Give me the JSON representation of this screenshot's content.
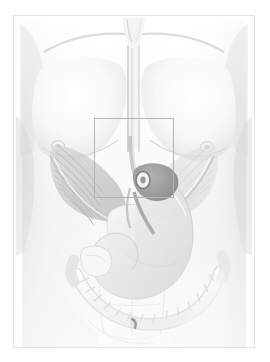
{
  "plate": {
    "title": "Anatomical illustration of male torso",
    "description": "Faded grayscale medical illustration: anterior view of a male thorax and abdomen with superficial musculature, stomach, and colon visible; a thin rectangular highlight box marks the epigastric / esophageal hiatus region.",
    "caption": "",
    "background_color": "#ffffff",
    "frame_color": "#e2e2e2",
    "roi_border_color": "#b4b4b4"
  },
  "palette": {
    "skin_light": "#fbfbfb",
    "skin_mid": "#ededed",
    "skin_shadow": "#dcdcdc",
    "skin_deep_shadow": "#c6c6c6",
    "muscle_mid": "#cfcfcf",
    "muscle_dark": "#a8a8a8",
    "organ_dark": "#8d8d8d",
    "organ_darkest": "#6f6f6f",
    "stomach_fill": "#e6e6e6",
    "colon_fill": "#f2f2f2",
    "outline": "#bdbdbd"
  },
  "roi": {
    "label": "highlight-box",
    "x": 93,
    "y": 117,
    "width": 80,
    "height": 80,
    "region_name": "esophageal hiatus / epigastrium"
  },
  "anatomy": {
    "landmarks": [
      {
        "name": "left-clavicle",
        "x": 60,
        "y": 30
      },
      {
        "name": "right-clavicle",
        "x": 180,
        "y": 30
      },
      {
        "name": "suprasternal-notch",
        "x": 120,
        "y": 22
      },
      {
        "name": "sternum",
        "x": 121,
        "y": 75
      },
      {
        "name": "left-nipple",
        "x": 44,
        "y": 130
      },
      {
        "name": "right-nipple",
        "x": 193,
        "y": 131
      },
      {
        "name": "umbilicus",
        "x": 120,
        "y": 307
      },
      {
        "name": "costal-margin-left",
        "x": 70,
        "y": 200
      },
      {
        "name": "costal-margin-right",
        "x": 175,
        "y": 200
      }
    ],
    "structures": [
      {
        "name": "pectoralis-major-left",
        "kind": "muscle"
      },
      {
        "name": "pectoralis-major-right",
        "kind": "muscle"
      },
      {
        "name": "external-oblique-left",
        "kind": "muscle"
      },
      {
        "name": "external-oblique-right",
        "kind": "muscle"
      },
      {
        "name": "rectus-abdominis",
        "kind": "muscle"
      },
      {
        "name": "diaphragm",
        "kind": "muscle"
      },
      {
        "name": "esophagus",
        "kind": "organ"
      },
      {
        "name": "gastroesophageal-junction",
        "kind": "organ"
      },
      {
        "name": "stomach",
        "kind": "organ"
      },
      {
        "name": "liver",
        "kind": "organ"
      },
      {
        "name": "transverse-colon",
        "kind": "organ"
      },
      {
        "name": "descending-colon",
        "kind": "organ"
      },
      {
        "name": "ascending-colon",
        "kind": "organ"
      },
      {
        "name": "small-intestine",
        "kind": "organ"
      }
    ]
  }
}
